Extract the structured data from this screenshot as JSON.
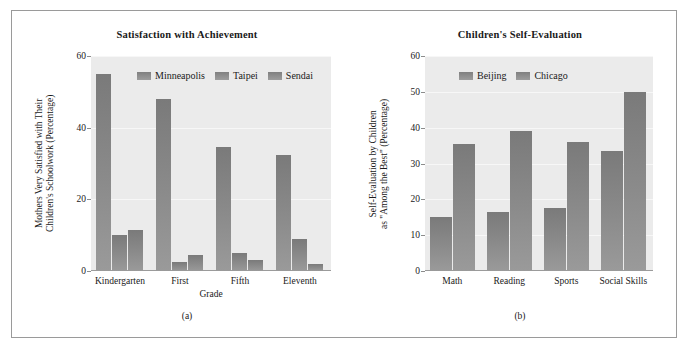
{
  "figure": {
    "background": "#ffffff",
    "border_color": "#9a9a9a",
    "bar_color": "#808080",
    "plot_background": "#ebebeb",
    "gridline_color": "#f7f7f7"
  },
  "panels": [
    {
      "caption": "(a)",
      "chart_data": {
        "type": "bar",
        "title": "Satisfaction with Achievement",
        "xlabel": "Grade",
        "ylabel": "Mothers Very Satisfied with Their Children's Schoolwork (Percentage)",
        "ylabel_line1": "Mothers Very Satisfied with Their",
        "ylabel_line2": "Children's Schoolwork (Percentage)",
        "categories": [
          "Kindergarten",
          "First",
          "Fifth",
          "Eleventh"
        ],
        "series": [
          {
            "name": "Minneapolis",
            "values": [
              55,
              48,
              34.5,
              32.5
            ]
          },
          {
            "name": "Taipei",
            "values": [
              10,
              2.5,
              5,
              9
            ]
          },
          {
            "name": "Sendai",
            "values": [
              11.5,
              4.5,
              3,
              2
            ]
          }
        ],
        "ylim": [
          0,
          60
        ],
        "yticks": [
          0,
          20,
          40,
          60
        ],
        "grid": true,
        "legend_position": "top-inside"
      }
    },
    {
      "caption": "(b)",
      "chart_data": {
        "type": "bar",
        "title": "Children's Self-Evaluation",
        "xlabel": "",
        "ylabel": "Self-Evaluation by Children as \"Among the Best\" (Percentage)",
        "ylabel_line1": "Self-Evaluation by Children",
        "ylabel_line2": "as \"Among the Best\" (Percentage)",
        "categories": [
          "Math",
          "Reading",
          "Sports",
          "Social Skills"
        ],
        "series": [
          {
            "name": "Beijing",
            "values": [
              15,
              16.5,
              17.5,
              33.5
            ]
          },
          {
            "name": "Chicago",
            "values": [
              35.5,
              39,
              36,
              50
            ]
          }
        ],
        "ylim": [
          0,
          60
        ],
        "yticks": [
          0,
          10,
          20,
          30,
          40,
          50,
          60
        ],
        "grid": true,
        "legend_position": "top-inside"
      }
    }
  ]
}
